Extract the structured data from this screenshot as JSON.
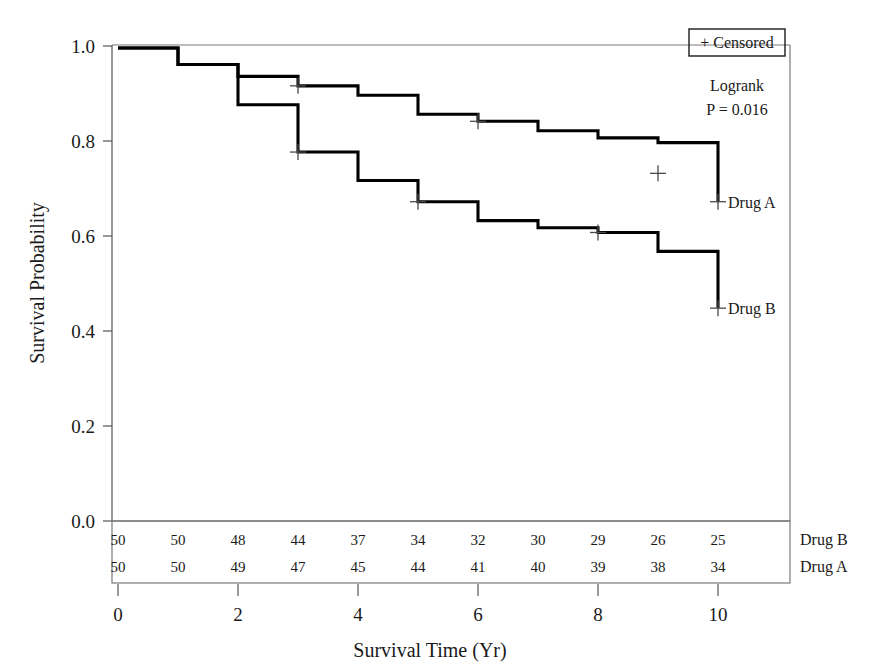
{
  "chart_data": {
    "type": "line",
    "subtype": "kaplan-meier-step",
    "title": "",
    "xlabel": "Survival Time (Yr)",
    "ylabel": "Survival Probability",
    "xlim": [
      0,
      11
    ],
    "ylim": [
      0.0,
      1.0
    ],
    "xticks": [
      0,
      2,
      4,
      6,
      8,
      10
    ],
    "xtick_labels": [
      "0",
      "2",
      "4",
      "6",
      "8",
      "10"
    ],
    "yticks": [
      0.0,
      0.2,
      0.4,
      0.6,
      0.8,
      1.0
    ],
    "ytick_labels": [
      "0.0",
      "0.2",
      "0.4",
      "0.6",
      "0.8",
      "1.0"
    ],
    "grid": false,
    "legend_position": "top-right",
    "series": [
      {
        "name": "Drug A",
        "label": "Drug A",
        "color": "#000000",
        "x": [
          0,
          1,
          2,
          3,
          4,
          5,
          6,
          7,
          8,
          9,
          10,
          10
        ],
        "values": [
          1.0,
          0.965,
          0.94,
          0.92,
          0.9,
          0.86,
          0.845,
          0.825,
          0.81,
          0.8,
          0.735,
          0.675
        ],
        "censored_x": [
          3,
          6,
          9,
          10
        ],
        "censored_y": [
          0.92,
          0.845,
          0.735,
          0.675
        ]
      },
      {
        "name": "Drug B",
        "label": "Drug B",
        "color": "#000000",
        "x": [
          0,
          1,
          2,
          3,
          4,
          5,
          6,
          7,
          8,
          9,
          10,
          10
        ],
        "values": [
          1.0,
          0.965,
          0.88,
          0.78,
          0.72,
          0.675,
          0.635,
          0.62,
          0.61,
          0.57,
          0.555,
          0.45
        ],
        "censored_x": [
          3,
          5,
          8,
          10
        ],
        "censored_y": [
          0.78,
          0.675,
          0.61,
          0.45
        ]
      }
    ],
    "annotations": [
      {
        "name": "logrank-label",
        "text": "Logrank"
      },
      {
        "name": "pvalue-label",
        "text": "P = 0.016"
      }
    ],
    "legend": {
      "items": [
        {
          "symbol": "+",
          "label": "Censored",
          "text": "+ Censored"
        }
      ]
    },
    "risk_table": {
      "times": [
        0,
        1,
        2,
        3,
        4,
        5,
        6,
        7,
        8,
        9,
        10
      ],
      "rows": [
        {
          "label": "Drug B",
          "counts": [
            50,
            50,
            48,
            44,
            37,
            34,
            32,
            30,
            29,
            26,
            25
          ]
        },
        {
          "label": "Drug A",
          "counts": [
            50,
            50,
            49,
            47,
            45,
            44,
            41,
            40,
            39,
            38,
            34
          ]
        }
      ]
    }
  },
  "figure": {
    "background": "#ffffff",
    "line_color": "#000000",
    "frame_color": "#7a7a7a"
  }
}
